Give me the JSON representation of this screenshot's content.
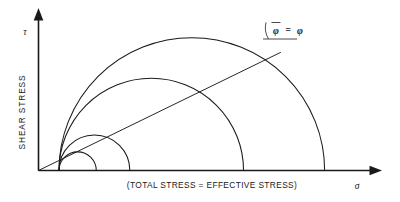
{
  "figure": {
    "type": "mohr-circle-diagram",
    "title_visible": false,
    "background": "#ffffff",
    "ink_color": "#1a1a1a"
  },
  "axes": {
    "y_axis": {
      "name_label": "SHEAR STRESS",
      "symbol": "τ",
      "orientation": "vertical",
      "arrow": true
    },
    "x_axis": {
      "name_label": "(TOTAL STRESS = EFFECTIVE STRESS)",
      "symbol": "σ",
      "orientation": "horizontal",
      "arrow": true
    }
  },
  "envelope": {
    "label_phi_bar": "φ",
    "label_equals": "=",
    "label_phi": "φ",
    "full_label": "φ̄ = φ",
    "passes_through_origin": true,
    "angle_degrees": 26
  },
  "chart_data": {
    "type": "scatter",
    "title": "",
    "xlabel": "(TOTAL STRESS = EFFECTIVE STRESS)",
    "ylabel": "SHEAR STRESS",
    "xlim": [
      0,
      360
    ],
    "ylim": [
      0,
      160
    ],
    "grid": false,
    "legend": "none",
    "annotations": [
      "φ̄ = φ"
    ],
    "series": [
      {
        "name": "mohr-circle-1",
        "sigma3": 22,
        "sigma1": 62,
        "center": 42,
        "radius": 20,
        "peak_tau": 20
      },
      {
        "name": "mohr-circle-2",
        "sigma3": 22,
        "sigma1": 98,
        "center": 60,
        "radius": 38,
        "peak_tau": 38
      },
      {
        "name": "mohr-circle-3",
        "sigma3": 22,
        "sigma1": 220,
        "center": 121,
        "radius": 99,
        "peak_tau": 99
      },
      {
        "name": "mohr-circle-4",
        "sigma3": 22,
        "sigma1": 307,
        "center": 164,
        "radius": 143,
        "peak_tau": 143
      }
    ],
    "envelope_line": {
      "name": "failure-envelope",
      "slope_degrees": 26,
      "intercept": 0,
      "x_from": 0,
      "x_to": 260
    }
  }
}
